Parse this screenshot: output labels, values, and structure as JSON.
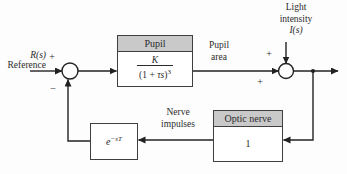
{
  "colors": {
    "line": "#222222",
    "text": "#2b2b2b",
    "header_fill": "#c9c9c9",
    "block_border": "#3f3f3f",
    "background": "#fdfdfd"
  },
  "labels": {
    "reference_signal": "R(s)",
    "reference_caption": "Reference",
    "sum1_plus": "+",
    "sum1_minus": "−",
    "pupil_area_line1": "Pupil",
    "pupil_area_line2": "area",
    "light_line1": "Light",
    "light_line2": "intensity",
    "light_signal": "I(s)",
    "sum2_plus_top": "+",
    "sum2_plus_left": "+",
    "nerve_line1": "Nerve",
    "nerve_line2": "impulses"
  },
  "blocks": {
    "pupil": {
      "title": "Pupil",
      "numerator": "K",
      "den_open": "(1 + ",
      "den_var": "τs",
      "den_close": ")",
      "den_exp": "3"
    },
    "optic_nerve": {
      "title": "Optic nerve",
      "value": "1"
    },
    "delay": {
      "base": "e",
      "exponent": "−sT"
    }
  }
}
